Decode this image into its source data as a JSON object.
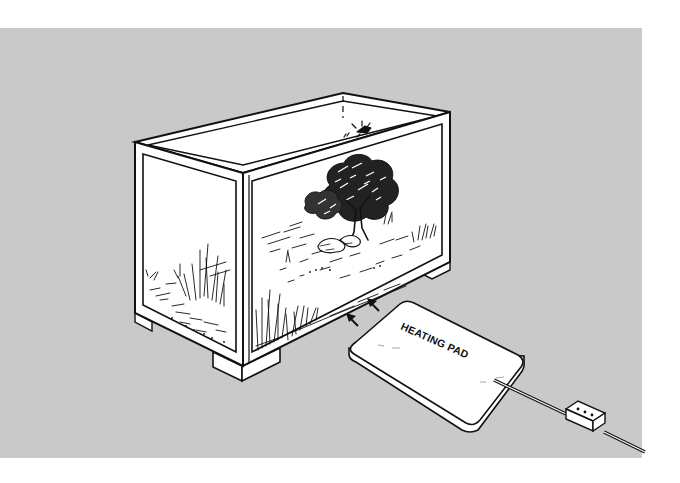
{
  "figure": {
    "background_color": "#c9c9c9",
    "page_color": "#ffffff",
    "line_color": "#111111",
    "panel_fill": "#ffffff"
  },
  "labels": {
    "heating_pad": "HEATING PAD"
  },
  "elements": {
    "tank": "glass terrarium with landscape scene (tree, rocks, grasses)",
    "arrows": "two heat arrows pointing from pad toward tank base",
    "heating_pad": "rectangular flat pad with rounded corners",
    "cord": "power cord with in-line thermostat/controller box"
  }
}
